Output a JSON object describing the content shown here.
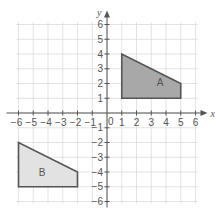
{
  "chart_data": {
    "type": "diagram",
    "title": "",
    "xlabel": "x",
    "ylabel": "y",
    "xlim": [
      -6,
      6
    ],
    "ylim": [
      -6,
      6
    ],
    "grid": true,
    "origin_label": "0",
    "x_ticks": [
      -6,
      -5,
      -4,
      -3,
      -2,
      -1,
      1,
      2,
      3,
      4,
      5,
      6
    ],
    "y_ticks": [
      -6,
      -5,
      -4,
      -3,
      -2,
      -1,
      1,
      2,
      3,
      4,
      5,
      6
    ],
    "shapes": [
      {
        "name": "A",
        "label": "A",
        "vertices": [
          [
            1,
            1
          ],
          [
            1,
            4
          ],
          [
            5,
            2
          ],
          [
            5,
            1
          ]
        ],
        "fill": "#a8a8a8",
        "label_at": [
          3.6,
          2.1
        ]
      },
      {
        "name": "B",
        "label": "B",
        "vertices": [
          [
            -6,
            -5
          ],
          [
            -6,
            -2
          ],
          [
            -2,
            -4
          ],
          [
            -2,
            -5
          ]
        ],
        "fill": "#e2e2e2",
        "label_at": [
          -4.4,
          -4.0
        ]
      }
    ]
  },
  "colors": {
    "axis": "#555555",
    "grid": "#dcdcdc",
    "background": "#ffffff"
  }
}
